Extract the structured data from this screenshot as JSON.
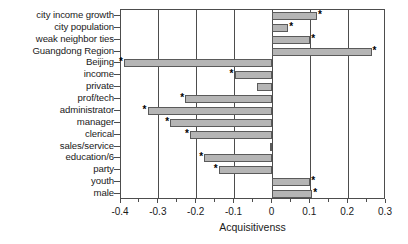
{
  "chart_data": {
    "type": "bar",
    "orientation": "horizontal",
    "title": "",
    "xlabel": "Acquisitivenss",
    "ylabel": "",
    "xlim": [
      -0.4,
      0.3
    ],
    "ylim": null,
    "grid": true,
    "legend": null,
    "xticks": [
      -0.4,
      -0.3,
      -0.2,
      -0.1,
      0,
      0.1,
      0.2,
      0.3
    ],
    "xticklabels": [
      "-0.4",
      "-0.3",
      "-0.2",
      "-0.1",
      "0",
      "0.1",
      "0.2",
      "0.3"
    ],
    "minor_xticks": [
      -0.35,
      -0.25,
      -0.15,
      -0.05,
      0.05,
      0.15,
      0.25
    ],
    "categories": [
      "city income growth",
      "city population",
      "weak neighbor ties",
      "Guangdong Region",
      "Beijing",
      "income",
      "private",
      "prof/tech",
      "administrator",
      "manager",
      "clerical",
      "sales/service",
      "education/6",
      "party",
      "youth",
      "male"
    ],
    "values": [
      0.118,
      0.042,
      0.1,
      0.262,
      -0.392,
      -0.1,
      -0.04,
      -0.23,
      -0.33,
      -0.27,
      -0.218,
      -0.007,
      -0.18,
      -0.142,
      0.1,
      0.105
    ],
    "significance": [
      true,
      true,
      true,
      true,
      true,
      true,
      false,
      true,
      true,
      true,
      true,
      false,
      true,
      true,
      true,
      true
    ],
    "significance_marker": "*",
    "bar_color": "#b5b5b5",
    "bar_edge_color": "#5a5a5a",
    "axis_color": "#4d4d4d"
  }
}
